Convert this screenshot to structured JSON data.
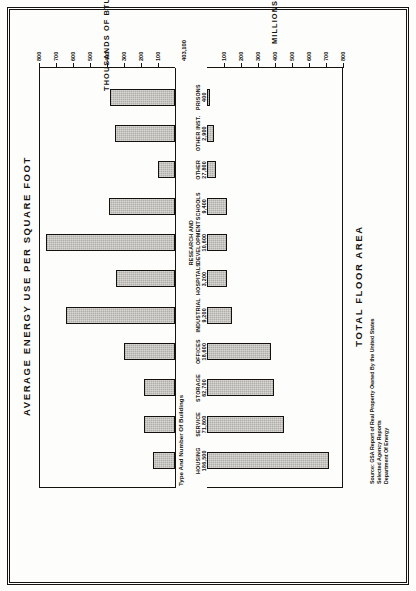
{
  "figure": {
    "top_title": "AVERAGE ENERGY USE PER SQUARE FOOT",
    "bottom_title": "TOTAL FLOOR AREA",
    "band_header": "Type And Number Of Buildings",
    "total_buildings": "403,100",
    "source_prefix": "Source:",
    "source_lines": [
      "GSA Report of Real Property Owned By the United States",
      "Selected Agency Reports",
      "Department Of Energy"
    ]
  },
  "chart_data": {
    "type": "bar",
    "orientation": "vertical-paired-rotated",
    "categories": [
      "HOUSING",
      "SERVICE",
      "STORAGE",
      "OFFICES",
      "INDUSTRIAL",
      "HOSPITALS",
      "RESEARCH AND DEVELOPMENT",
      "SCHOOLS",
      "OTHER",
      "OTHER INST.",
      "PRISONS"
    ],
    "building_counts": [
      "186,500",
      "71,800",
      "62,700",
      "18,600",
      "9,200",
      "3,200",
      "10,600",
      "9,400",
      "27,800",
      "2,900",
      "400"
    ],
    "series": [
      {
        "name": "Average Energy Use Per Square Foot",
        "unit": "THOUSANDS OF BTU",
        "axis": "top",
        "values": [
          130,
          180,
          180,
          300,
          640,
          345,
          760,
          390,
          100,
          355,
          380
        ],
        "ylim": [
          0,
          800
        ],
        "ticks": [
          100,
          200,
          300,
          400,
          500,
          600,
          700,
          800
        ]
      },
      {
        "name": "Total Floor Area",
        "unit": "MILLIONS OF SQUARE FEET",
        "axis": "bottom",
        "values": [
          715,
          455,
          395,
          375,
          145,
          120,
          120,
          120,
          55,
          40,
          10
        ],
        "ylim": [
          0,
          800
        ],
        "ticks": [
          100,
          200,
          300,
          400,
          500,
          600,
          700,
          800
        ]
      }
    ],
    "xlabel": "Type And Number Of Buildings",
    "grid": false,
    "legend": "none"
  },
  "axes": {
    "top": {
      "caption": "THOUSANDS OF BTU",
      "labels": [
        "100",
        "200",
        "300",
        "400",
        "500",
        "600",
        "700",
        "800"
      ]
    },
    "bottom": {
      "caption": "MILLIONS OF SQUARE FEET",
      "labels": [
        "100",
        "200",
        "300",
        "400",
        "500",
        "600",
        "700",
        "800"
      ]
    }
  }
}
